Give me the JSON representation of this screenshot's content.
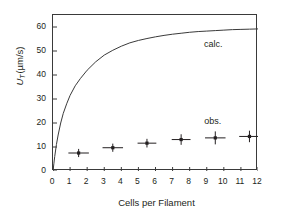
{
  "chart_data": {
    "type": "line",
    "title": "",
    "xlabel": "Cells per Filament",
    "ylabel": "U_T (µm/s)",
    "ylabel_parts": {
      "symbol": "U",
      "subscript": "T",
      "units": "(µm/s)"
    },
    "xlim": [
      0,
      12
    ],
    "ylim": [
      0,
      65
    ],
    "xticks": [
      0,
      1,
      2,
      3,
      4,
      5,
      6,
      7,
      8,
      9,
      10,
      11,
      12
    ],
    "xticklabels": [
      "0",
      "1",
      "2",
      "3",
      "4",
      "5",
      "6",
      "7",
      "8",
      "9",
      "10",
      "11",
      "12"
    ],
    "yticks": [
      0,
      10,
      20,
      30,
      40,
      50,
      60
    ],
    "yticklabels": [
      "0",
      "10",
      "20",
      "30",
      "40",
      "50",
      "60"
    ],
    "grid": false,
    "legend": "inline-annotations",
    "line_color": "#3a3a3a",
    "marker_color": "#231f20",
    "series": [
      {
        "name": "calc.",
        "type": "line",
        "annotation": "calc.",
        "annotation_xy": [
          9.6,
          52
        ],
        "x": [
          0.0,
          0.05,
          0.1,
          0.2,
          0.3,
          0.45,
          0.6,
          0.8,
          1.0,
          1.3,
          1.6,
          2.0,
          2.5,
          3.0,
          3.5,
          4.0,
          4.5,
          5.0,
          5.5,
          6.0,
          6.5,
          7.0,
          7.5,
          8.0,
          8.5,
          9.0,
          9.5,
          10.0,
          10.5,
          11.0,
          11.5,
          12.0
        ],
        "y": [
          0.0,
          3.0,
          6.0,
          11.0,
          15.0,
          20.0,
          24.0,
          28.0,
          31.5,
          35.5,
          38.5,
          42.0,
          45.5,
          48.3,
          50.3,
          52.0,
          53.4,
          54.4,
          55.2,
          55.9,
          56.5,
          57.0,
          57.4,
          57.8,
          58.1,
          58.3,
          58.5,
          58.7,
          58.9,
          59.0,
          59.1,
          59.2
        ]
      },
      {
        "name": "obs.",
        "type": "scatter-errorbar",
        "annotation": "obs.",
        "annotation_xy": [
          9.5,
          20
        ],
        "x": [
          1.5,
          3.5,
          5.5,
          7.5,
          9.5,
          11.5
        ],
        "y": [
          7.5,
          9.7,
          11.6,
          13.1,
          13.8,
          14.4
        ],
        "yerr": [
          1.7,
          1.7,
          1.8,
          2.2,
          2.7,
          2.4
        ],
        "xerr": [
          0.6,
          0.6,
          0.55,
          0.55,
          0.6,
          0.6
        ]
      }
    ]
  },
  "annotations": {
    "calc_label": "calc.",
    "obs_label": "obs."
  },
  "axis": {
    "x_title": "Cells per Filament",
    "y_symbol": "U",
    "y_subscript": "T",
    "y_units": "(µm/s)"
  }
}
